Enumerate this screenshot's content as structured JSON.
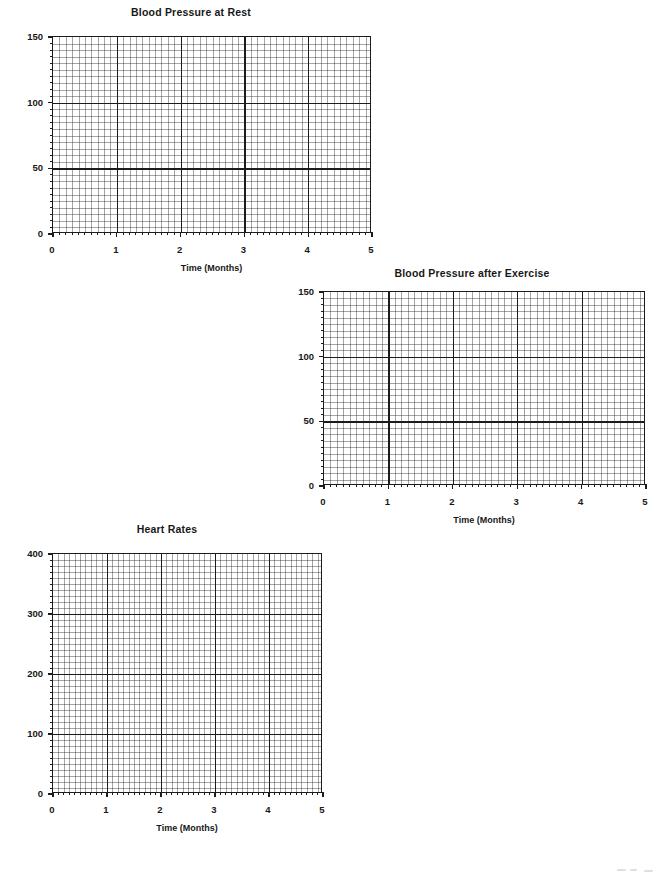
{
  "document": {
    "kind": "blank-graph-worksheet",
    "background_color": "#ffffff",
    "ink_color": "#1c1c1c"
  },
  "charts": [
    {
      "id": "blood-pressure-at-rest",
      "title": "Blood Pressure at Rest",
      "xlabel": "Time (Months)",
      "ylabel": "",
      "x_ticks": [
        "0",
        "1",
        "2",
        "3",
        "4",
        "5"
      ],
      "y_ticks": [
        "0",
        "50",
        "100",
        "150"
      ]
    },
    {
      "id": "blood-pressure-after-exercise",
      "title": "Blood Pressure after Exercise",
      "xlabel": "Time (Months)",
      "ylabel": "",
      "x_ticks": [
        "0",
        "1",
        "2",
        "3",
        "4",
        "5"
      ],
      "y_ticks": [
        "0",
        "50",
        "100",
        "150"
      ]
    },
    {
      "id": "heart-rates",
      "title": "Heart Rates",
      "xlabel": "Time (Months)",
      "ylabel": "",
      "x_ticks": [
        "0",
        "1",
        "2",
        "3",
        "4",
        "5"
      ],
      "y_ticks": [
        "0",
        "100",
        "200",
        "300",
        "400"
      ]
    }
  ],
  "chart_data": [
    {
      "type": "line",
      "title": "Blood Pressure at Rest",
      "xlabel": "Time (Months)",
      "ylabel": "",
      "x": [],
      "series": [],
      "values": [],
      "categories": [],
      "xlim": [
        0,
        5
      ],
      "ylim": [
        0,
        150
      ],
      "x_tick_values": [
        0,
        1,
        2,
        3,
        4,
        5
      ],
      "y_tick_values": [
        0,
        50,
        100,
        150
      ],
      "x_minor_per_major": 10,
      "y_minor_per_major": 10,
      "grid": true,
      "legend": "none",
      "note": "Empty grid template — no data plotted"
    },
    {
      "type": "line",
      "title": "Blood Pressure after Exercise",
      "xlabel": "Time (Months)",
      "ylabel": "",
      "x": [],
      "series": [],
      "values": [],
      "categories": [],
      "xlim": [
        0,
        5
      ],
      "ylim": [
        0,
        150
      ],
      "x_tick_values": [
        0,
        1,
        2,
        3,
        4,
        5
      ],
      "y_tick_values": [
        0,
        50,
        100,
        150
      ],
      "x_minor_per_major": 10,
      "y_minor_per_major": 10,
      "grid": true,
      "legend": "none",
      "note": "Empty grid template — no data plotted"
    },
    {
      "type": "line",
      "title": "Heart Rates",
      "xlabel": "Time (Months)",
      "ylabel": "",
      "x": [],
      "series": [],
      "values": [],
      "categories": [],
      "xlim": [
        0,
        5
      ],
      "ylim": [
        0,
        400
      ],
      "x_tick_values": [
        0,
        1,
        2,
        3,
        4,
        5
      ],
      "y_tick_values": [
        0,
        100,
        200,
        300,
        400
      ],
      "x_minor_per_major": 10,
      "y_minor_per_major": 10,
      "grid": true,
      "legend": "none",
      "note": "Empty grid template — no data plotted"
    }
  ]
}
